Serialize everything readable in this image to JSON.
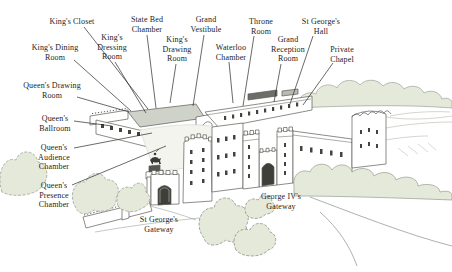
{
  "figure": {
    "colors": {
      "ink": "#2a2a28",
      "line": "#5a5a54",
      "window": "#44443f",
      "arch_dark": "#3f3f3a",
      "roof_gray": "#cfd2c9",
      "roof_dark": "#6e6e68",
      "wash_green": "#e4e9da",
      "wash_ground": "#f3f4ee",
      "paper": "#ffffff"
    },
    "labels": [
      {
        "id": "kings-closet",
        "lines": [
          "King's Closet"
        ],
        "x": 72,
        "y": 24,
        "leader": [
          84,
          27,
          148,
          109
        ]
      },
      {
        "id": "state-bed-chamber",
        "lines": [
          "State Bed",
          "Chamber"
        ],
        "x": 147,
        "y": 22,
        "leader": [
          147,
          35,
          156,
          108
        ]
      },
      {
        "id": "grand-vestibule",
        "lines": [
          "Grand",
          "Vestibule"
        ],
        "x": 206,
        "y": 22,
        "leader": [
          204,
          35,
          193,
          106
        ]
      },
      {
        "id": "kings-dining-room",
        "lines": [
          "King's Dining",
          "Room"
        ],
        "x": 55,
        "y": 50,
        "leader": [
          74,
          60,
          131,
          111
        ]
      },
      {
        "id": "kings-dressing-room",
        "lines": [
          "King's",
          "Dressing",
          "Room"
        ],
        "x": 112,
        "y": 40,
        "leader": [
          115,
          62,
          146,
          113
        ]
      },
      {
        "id": "kings-drawing-room",
        "lines": [
          "King's",
          "Drawing",
          "Room"
        ],
        "x": 177,
        "y": 42,
        "leader": [
          176,
          64,
          170,
          103
        ]
      },
      {
        "id": "waterloo-chamber",
        "lines": [
          "Waterloo",
          "Chamber"
        ],
        "x": 231,
        "y": 50,
        "leader": [
          229,
          62,
          233,
          103
        ]
      },
      {
        "id": "throne-room",
        "lines": [
          "Throne",
          "Room"
        ],
        "x": 261,
        "y": 24,
        "leader": [
          254,
          36,
          243,
          106
        ]
      },
      {
        "id": "grand-reception-room",
        "lines": [
          "Grand",
          "Reception",
          "Room"
        ],
        "x": 288,
        "y": 42,
        "leader": [
          281,
          64,
          274,
          102
        ]
      },
      {
        "id": "st-georges-hall",
        "lines": [
          "St George's",
          "Hall"
        ],
        "x": 321,
        "y": 24,
        "leader": [
          313,
          36,
          290,
          104
        ]
      },
      {
        "id": "private-chapel",
        "lines": [
          "Private",
          "Chapel"
        ],
        "x": 342,
        "y": 52,
        "leader": [
          333,
          63,
          303,
          105
        ]
      },
      {
        "id": "queens-drawing-room",
        "lines": [
          "Queen's Drawing",
          "Room"
        ],
        "x": 52,
        "y": 88,
        "leader": [
          77,
          97,
          129,
          112
        ]
      },
      {
        "id": "queens-ballroom",
        "lines": [
          "Queen's",
          "Ballroom"
        ],
        "x": 55,
        "y": 121,
        "leader": [
          74,
          121,
          112,
          126
        ]
      },
      {
        "id": "queens-audience-chamber",
        "lines": [
          "Queen's",
          "Audience",
          "Chamber"
        ],
        "x": 54,
        "y": 150,
        "leader": [
          74,
          148,
          152,
          133
        ]
      },
      {
        "id": "queens-presence-chamber",
        "lines": [
          "Queen's",
          "Presence",
          "Chamber"
        ],
        "x": 54,
        "y": 188,
        "leader": [
          72,
          185,
          166,
          146
        ]
      },
      {
        "id": "st-georges-gateway",
        "lines": [
          "St George's",
          "Gateway"
        ],
        "x": 159,
        "y": 222,
        "leader": null
      },
      {
        "id": "george-iv-gateway",
        "lines": [
          "George IV's",
          "Gateway"
        ],
        "x": 281,
        "y": 199,
        "leader": null
      }
    ]
  }
}
